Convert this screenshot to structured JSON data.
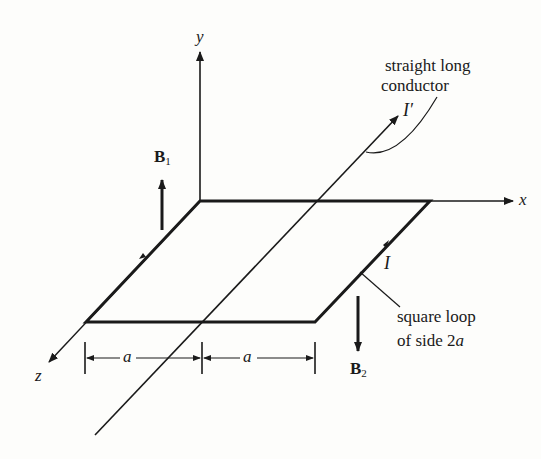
{
  "figure": {
    "axes": {
      "x_label": "x",
      "y_label": "y",
      "z_label": "z"
    },
    "conductor": {
      "label_line1": "straight long",
      "label_line2": "conductor",
      "current_label": "I′"
    },
    "loop": {
      "label_line1": "square loop",
      "label_line2_prefix": "of side 2",
      "label_line2_var": "a",
      "current_label": "I"
    },
    "fields": {
      "b1_main": "B",
      "b1_sub": "1",
      "b2_main": "B",
      "b2_sub": "2"
    },
    "dimensions": {
      "left": "a",
      "right": "a"
    },
    "colors": {
      "ink": "#1a1a1a",
      "background": "#fdfdfb"
    }
  }
}
